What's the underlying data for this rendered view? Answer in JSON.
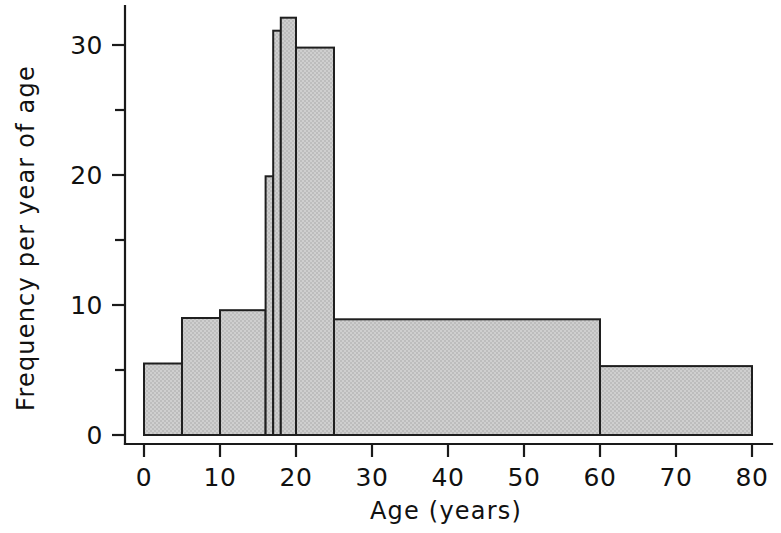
{
  "figure": {
    "background_color": "#ffffff",
    "bar_fill_color": "#c9c9c9",
    "bar_edge_color": "#1f1f1f",
    "axis_color": "#1a1a1a"
  },
  "chart_data": {
    "type": "bar",
    "title": "",
    "subtitle": "",
    "xlabel": "Age (years)",
    "ylabel": "Frequency per year of age",
    "xlim": [
      0,
      80
    ],
    "ylim": [
      0,
      33
    ],
    "grid": false,
    "legend": null,
    "x_ticks": [
      0,
      10,
      20,
      30,
      40,
      50,
      60,
      70,
      80
    ],
    "x_tick_labels": [
      "0",
      "10",
      "20",
      "30",
      "40",
      "50",
      "60",
      "70",
      "80"
    ],
    "y_ticks": [
      0,
      10,
      20,
      30
    ],
    "y_tick_labels": [
      "0",
      "10",
      "20",
      "30"
    ],
    "y_minor_ticks": [
      5,
      15,
      25
    ],
    "bin_edges": [
      0,
      5,
      10,
      16,
      17,
      18,
      20,
      25,
      60,
      80
    ],
    "bins": [
      {
        "x0": 0,
        "x1": 5,
        "value": 5.5,
        "label": "0-5"
      },
      {
        "x0": 5,
        "x1": 10,
        "value": 9.0,
        "label": "5-10"
      },
      {
        "x0": 10,
        "x1": 16,
        "value": 9.6,
        "label": "10-16"
      },
      {
        "x0": 16,
        "x1": 17,
        "value": 19.9,
        "label": "16-17"
      },
      {
        "x0": 17,
        "x1": 18,
        "value": 31.1,
        "label": "17-18"
      },
      {
        "x0": 18,
        "x1": 20,
        "value": 32.1,
        "label": "18-20"
      },
      {
        "x0": 20,
        "x1": 25,
        "value": 29.8,
        "label": "20-25"
      },
      {
        "x0": 25,
        "x1": 60,
        "value": 8.9,
        "label": "25-60"
      },
      {
        "x0": 60,
        "x1": 80,
        "value": 5.3,
        "label": "60-80"
      }
    ],
    "values": [
      5.5,
      9.0,
      9.6,
      19.9,
      31.1,
      32.1,
      29.8,
      8.9,
      5.3
    ],
    "categories": [
      "0-5",
      "5-10",
      "10-16",
      "16-17",
      "17-18",
      "18-20",
      "20-25",
      "25-60",
      "60-80"
    ]
  }
}
